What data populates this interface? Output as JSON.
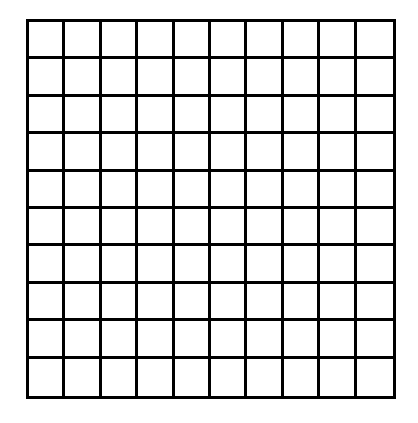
{
  "grid": {
    "rows": 10,
    "cols": 10,
    "line_color": "#000000",
    "fill_color": "#ffffff",
    "cells_filled": []
  }
}
